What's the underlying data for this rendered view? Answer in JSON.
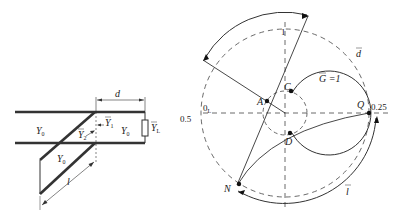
{
  "circuit": {
    "labels": {
      "d": "d",
      "l": "l",
      "y0_left": "Y",
      "y0_right": "Y",
      "y0_stub": "Y",
      "y0_sub": "0",
      "y1": "Y",
      "y1_sub": "1",
      "y2": "Y",
      "y2_sub": "2",
      "yl": "Y",
      "yl_sub": "L"
    }
  },
  "smith_chart": {
    "points": {
      "A": "A",
      "C": "C",
      "D": "D",
      "Q": "Q",
      "N": "N"
    },
    "labels": {
      "g_circle": "G =1",
      "d_bar": "d",
      "l_bar": "l",
      "zero": "0",
      "zero_sub": "L",
      "half": "0.5",
      "quarter": "0.25",
      "one": "1"
    }
  }
}
